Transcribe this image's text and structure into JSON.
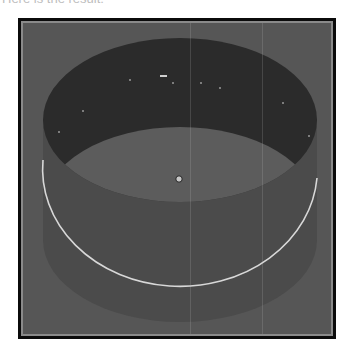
{
  "caption": "Here is the result:",
  "viewport": {
    "background_color": "#565656",
    "frame_color": "#0b0b0b",
    "inset_color": "#8a8a8a",
    "scene": {
      "object": "cylinder",
      "outer_wall_color": "#4b4b4b",
      "inner_wall_color": "#2b2b2b",
      "floor_color": "#5c5c5c",
      "selection_ring_color": "#d8d8d8",
      "pivot_color": "#c8c8c8"
    }
  }
}
